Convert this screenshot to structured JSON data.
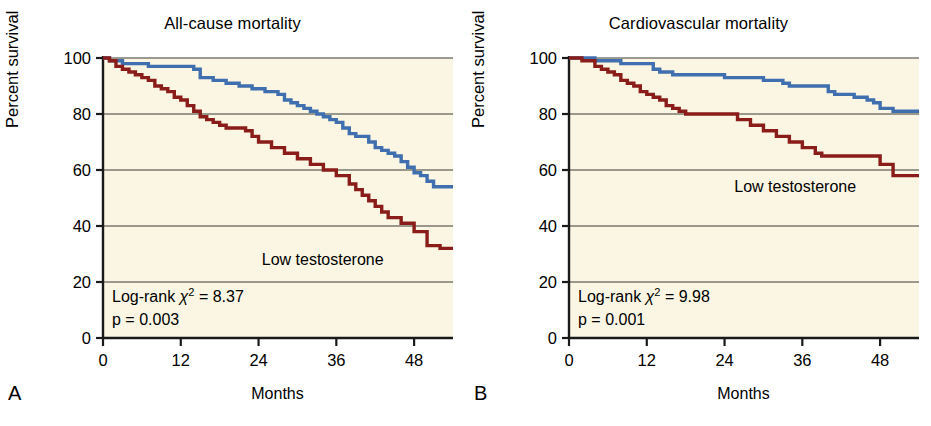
{
  "figure": {
    "background_color": "#ffffff",
    "plot_background_color": "#faf6e3",
    "axis_color": "#1a1a1a",
    "gridline_color": "#3a3a32"
  },
  "panels": [
    {
      "letter": "A",
      "title": "All-cause mortality",
      "xlabel": "Months",
      "ylabel": "Percent survival",
      "curve_label": "Low testosterone",
      "stat_prefix": "Log-rank ",
      "stat_chi": "χ",
      "stat_sup": "2",
      "stat_value": " = 8.37",
      "pvalue": "p = 0.003"
    },
    {
      "letter": "B",
      "title": "Cardiovascular mortality",
      "xlabel": "Months",
      "ylabel": "Percent survival",
      "curve_label": "Low testosterone",
      "stat_prefix": "Log-rank ",
      "stat_chi": "χ",
      "stat_sup": "2",
      "stat_value": " = 9.98",
      "pvalue": "p = 0.001"
    }
  ],
  "chart_data": [
    {
      "type": "line",
      "panel": "A",
      "title": "All-cause mortality",
      "xlabel": "Months",
      "ylabel": "Percent survival",
      "xlim": [
        0,
        54
      ],
      "ylim": [
        0,
        100
      ],
      "xticks": [
        0,
        12,
        24,
        36,
        48
      ],
      "yticks": [
        0,
        20,
        40,
        60,
        80,
        100
      ],
      "grid": true,
      "legend_position": "none",
      "annotations": [
        "Low testosterone",
        "Log-rank χ² = 8.37",
        "p = 0.003"
      ],
      "series": [
        {
          "name": "Normal testosterone",
          "color": "#3f6fae",
          "step": "post",
          "x": [
            0,
            1,
            3,
            5,
            7,
            9,
            12,
            14,
            15,
            16,
            17,
            18,
            19,
            20,
            21,
            22,
            23,
            24,
            25,
            26,
            27,
            28,
            29,
            30,
            31,
            32,
            33,
            34,
            35,
            36,
            37,
            38,
            39,
            40,
            41,
            42,
            43,
            44,
            45,
            46,
            47,
            48,
            49,
            50,
            51,
            52,
            54
          ],
          "y": [
            100,
            99,
            98,
            98,
            97,
            97,
            97,
            96,
            93,
            93,
            92,
            92,
            91,
            91,
            90,
            90,
            89,
            89,
            88,
            88,
            87,
            85,
            84,
            83,
            82,
            81,
            80,
            79,
            78,
            77,
            75,
            73,
            72,
            72,
            70,
            68,
            67,
            66,
            65,
            63,
            61,
            59,
            58,
            56,
            54,
            54,
            54
          ]
        },
        {
          "name": "Low testosterone",
          "color": "#8a1c1a",
          "step": "post",
          "x": [
            0,
            1,
            2,
            3,
            4,
            5,
            6,
            7,
            8,
            9,
            10,
            11,
            12,
            13,
            14,
            15,
            16,
            17,
            18,
            19,
            20,
            21,
            22,
            23,
            24,
            26,
            28,
            30,
            32,
            34,
            36,
            38,
            39,
            40,
            41,
            42,
            43,
            44,
            46,
            48,
            50,
            52,
            54
          ],
          "y": [
            100,
            99,
            97,
            96,
            95,
            94,
            93,
            92,
            90,
            89,
            88,
            86,
            85,
            83,
            81,
            79,
            78,
            77,
            76,
            75,
            75,
            75,
            74,
            72,
            70,
            68,
            66,
            64,
            62,
            60,
            58,
            55,
            53,
            51,
            49,
            47,
            45,
            43,
            41,
            38,
            33,
            32,
            32
          ]
        }
      ]
    },
    {
      "type": "line",
      "panel": "B",
      "title": "Cardiovascular mortality",
      "xlabel": "Months",
      "ylabel": "Percent survival",
      "xlim": [
        0,
        54
      ],
      "ylim": [
        0,
        100
      ],
      "xticks": [
        0,
        12,
        24,
        36,
        48
      ],
      "yticks": [
        0,
        20,
        40,
        60,
        80,
        100
      ],
      "grid": true,
      "legend_position": "none",
      "annotations": [
        "Low testosterone",
        "Log-rank χ² = 9.98",
        "p = 0.001"
      ],
      "series": [
        {
          "name": "Normal testosterone",
          "color": "#3f6fae",
          "step": "post",
          "x": [
            0,
            2,
            4,
            6,
            8,
            10,
            12,
            13,
            14,
            15,
            16,
            18,
            20,
            22,
            24,
            26,
            28,
            30,
            32,
            33,
            34,
            36,
            38,
            40,
            41,
            42,
            44,
            45,
            46,
            47,
            48,
            50,
            52,
            54
          ],
          "y": [
            100,
            100,
            99,
            99,
            98,
            98,
            98,
            96,
            95,
            95,
            94,
            94,
            94,
            94,
            93,
            93,
            93,
            92,
            92,
            91,
            90,
            90,
            90,
            88,
            87,
            87,
            86,
            86,
            85,
            84,
            82,
            81,
            81,
            81
          ]
        },
        {
          "name": "Low testosterone",
          "color": "#8a1c1a",
          "step": "post",
          "x": [
            0,
            2,
            4,
            5,
            6,
            7,
            8,
            9,
            10,
            11,
            12,
            13,
            14,
            15,
            16,
            17,
            18,
            19,
            20,
            21,
            22,
            24,
            26,
            28,
            30,
            32,
            34,
            36,
            38,
            39,
            40,
            41,
            42,
            44,
            46,
            48,
            50,
            52,
            54
          ],
          "y": [
            100,
            99,
            97,
            96,
            95,
            94,
            92,
            91,
            90,
            88,
            87,
            86,
            85,
            83,
            82,
            81,
            80,
            80,
            80,
            80,
            80,
            80,
            78,
            76,
            74,
            72,
            70,
            68,
            66,
            65,
            65,
            65,
            65,
            65,
            65,
            62,
            58,
            58,
            58
          ]
        }
      ]
    }
  ]
}
